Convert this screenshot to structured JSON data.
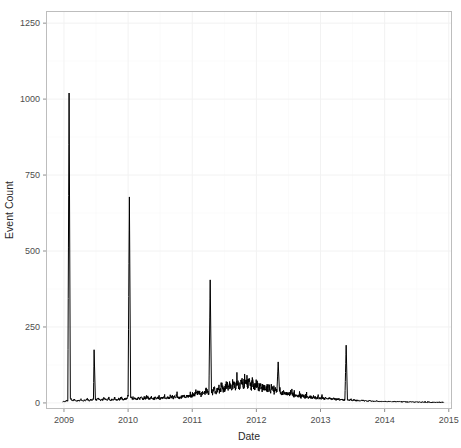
{
  "chart_data": {
    "type": "line",
    "title": "",
    "subtitle": "",
    "xlabel": "Date",
    "ylabel": "Event Count",
    "grid": true,
    "legend": null,
    "xlim": [
      2008.72,
      2015.05
    ],
    "ylim": [
      -20,
      1290
    ],
    "x_ticks": [
      "2009",
      "2010",
      "2011",
      "2012",
      "2013",
      "2014",
      "2015"
    ],
    "x_tick_values": [
      2009,
      2010,
      2011,
      2012,
      2013,
      2014,
      2015
    ],
    "y_ticks": [
      "0",
      "250",
      "500",
      "750",
      "1000",
      "1250"
    ],
    "y_tick_values": [
      0,
      250,
      500,
      750,
      1000,
      1250
    ],
    "series_name": "Event Count",
    "series_color": "#000000",
    "annotations": [
      {
        "label": "peak-2009",
        "x": 2009.08,
        "y": 1020
      },
      {
        "label": "peak-2009b",
        "x": 2009.47,
        "y": 175
      },
      {
        "label": "peak-2010",
        "x": 2010.02,
        "y": 678
      },
      {
        "label": "peak-2011",
        "x": 2011.3,
        "y": 405
      },
      {
        "label": "peak-2012",
        "x": 2012.28,
        "y": 135
      },
      {
        "label": "peak-2013",
        "x": 2013.4,
        "y": 190
      }
    ],
    "x": [
      2008.98,
      2009.0,
      2009.02,
      2009.04,
      2009.06,
      2009.08,
      2009.1,
      2009.12,
      2009.14,
      2009.16,
      2009.18,
      2009.2,
      2009.22,
      2009.24,
      2009.26,
      2009.28,
      2009.3,
      2009.32,
      2009.34,
      2009.36,
      2009.38,
      2009.4,
      2009.42,
      2009.44,
      2009.46,
      2009.47,
      2009.49,
      2009.51,
      2009.53,
      2009.55,
      2009.57,
      2009.59,
      2009.61,
      2009.63,
      2009.65,
      2009.67,
      2009.69,
      2009.71,
      2009.73,
      2009.75,
      2009.77,
      2009.79,
      2009.81,
      2009.83,
      2009.85,
      2009.87,
      2009.89,
      2009.91,
      2009.93,
      2009.95,
      2009.97,
      2009.99,
      2010.0,
      2010.02,
      2010.04,
      2010.06,
      2010.08,
      2010.1,
      2010.12,
      2010.14,
      2010.16,
      2010.18,
      2010.2,
      2010.22,
      2010.24,
      2010.26,
      2010.28,
      2010.3,
      2010.32,
      2010.34,
      2010.36,
      2010.38,
      2010.4,
      2010.42,
      2010.44,
      2010.46,
      2010.48,
      2010.5,
      2010.52,
      2010.54,
      2010.56,
      2010.58,
      2010.6,
      2010.62,
      2010.64,
      2010.66,
      2010.68,
      2010.7,
      2010.72,
      2010.74,
      2010.76,
      2010.78,
      2010.8,
      2010.82,
      2010.84,
      2010.86,
      2010.88,
      2010.9,
      2010.92,
      2010.94,
      2010.96,
      2010.98,
      2011.0,
      2011.02,
      2011.04,
      2011.06,
      2011.08,
      2011.1,
      2011.12,
      2011.14,
      2011.16,
      2011.18,
      2011.2,
      2011.22,
      2011.24,
      2011.26,
      2011.28,
      2011.3,
      2011.32,
      2011.34,
      2011.36,
      2011.38,
      2011.4,
      2011.42,
      2011.44,
      2011.46,
      2011.48,
      2011.5,
      2011.52,
      2011.54,
      2011.56,
      2011.58,
      2011.6,
      2011.62,
      2011.64,
      2011.66,
      2011.68,
      2011.7,
      2011.72,
      2011.74,
      2011.76,
      2011.78,
      2011.8,
      2011.82,
      2011.84,
      2011.86,
      2011.88,
      2011.9,
      2011.92,
      2011.94,
      2011.96,
      2011.98,
      2012.0,
      2012.02,
      2012.04,
      2012.06,
      2012.08,
      2012.1,
      2012.12,
      2012.14,
      2012.16,
      2012.18,
      2012.2,
      2012.22,
      2012.24,
      2012.26,
      2012.28,
      2012.3,
      2012.32,
      2012.34,
      2012.36,
      2012.38,
      2012.4,
      2012.42,
      2012.44,
      2012.46,
      2012.48,
      2012.5,
      2012.52,
      2012.54,
      2012.56,
      2012.58,
      2012.6,
      2012.62,
      2012.64,
      2012.66,
      2012.68,
      2012.7,
      2012.72,
      2012.74,
      2012.76,
      2012.78,
      2012.8,
      2012.82,
      2012.84,
      2012.86,
      2012.88,
      2012.9,
      2012.92,
      2012.94,
      2012.96,
      2012.98,
      2013.0,
      2013.02,
      2013.04,
      2013.06,
      2013.08,
      2013.1,
      2013.12,
      2013.14,
      2013.16,
      2013.18,
      2013.2,
      2013.22,
      2013.24,
      2013.26,
      2013.28,
      2013.3,
      2013.32,
      2013.34,
      2013.36,
      2013.38,
      2013.4,
      2013.42,
      2013.44,
      2013.46,
      2013.48,
      2013.5,
      2013.52,
      2013.54,
      2013.56,
      2013.58,
      2013.6,
      2013.62,
      2013.64,
      2013.66,
      2013.68,
      2013.7,
      2013.72,
      2013.74,
      2013.76,
      2013.78,
      2013.8,
      2013.82,
      2013.84,
      2013.86,
      2013.88,
      2013.9,
      2013.92,
      2013.94,
      2013.96,
      2013.98,
      2014.0,
      2014.02,
      2014.04,
      2014.06,
      2014.08,
      2014.1,
      2014.12,
      2014.14,
      2014.16,
      2014.18,
      2014.2,
      2014.22,
      2014.24,
      2014.26,
      2014.28,
      2014.3,
      2014.32,
      2014.34,
      2014.36,
      2014.38,
      2014.4,
      2014.42,
      2014.44,
      2014.46,
      2014.48,
      2014.5,
      2014.52,
      2014.54,
      2014.56,
      2014.58,
      2014.6,
      2014.62,
      2014.64,
      2014.66,
      2014.68,
      2014.7,
      2014.72,
      2014.74,
      2014.76,
      2014.78,
      2014.8,
      2014.82,
      2014.84,
      2014.86,
      2014.88,
      2014.9,
      2014.92
    ],
    "values": [
      3,
      5,
      4,
      8,
      6,
      1020,
      14,
      9,
      6,
      11,
      7,
      5,
      9,
      6,
      12,
      8,
      5,
      10,
      7,
      14,
      9,
      6,
      11,
      8,
      13,
      175,
      12,
      8,
      15,
      10,
      7,
      13,
      9,
      16,
      11,
      8,
      14,
      10,
      7,
      12,
      9,
      15,
      11,
      8,
      13,
      10,
      16,
      12,
      9,
      14,
      11,
      18,
      22,
      678,
      19,
      15,
      12,
      17,
      13,
      10,
      16,
      12,
      19,
      14,
      11,
      17,
      13,
      20,
      15,
      12,
      18,
      14,
      11,
      16,
      13,
      19,
      15,
      12,
      17,
      14,
      21,
      16,
      13,
      18,
      15,
      22,
      17,
      14,
      19,
      16,
      23,
      18,
      15,
      20,
      17,
      24,
      19,
      16,
      21,
      18,
      25,
      20,
      24,
      28,
      22,
      31,
      26,
      35,
      29,
      24,
      38,
      31,
      27,
      42,
      34,
      29,
      405,
      36,
      31,
      45,
      38,
      33,
      48,
      41,
      36,
      52,
      44,
      38,
      56,
      47,
      41,
      60,
      50,
      44,
      64,
      53,
      46,
      68,
      57,
      49,
      72,
      60,
      52,
      75,
      63,
      54,
      70,
      58,
      50,
      66,
      55,
      47,
      62,
      52,
      45,
      58,
      49,
      42,
      54,
      46,
      39,
      50,
      43,
      37,
      46,
      40,
      34,
      42,
      36,
      135,
      38,
      33,
      28,
      35,
      30,
      26,
      32,
      27,
      23,
      29,
      25,
      21,
      27,
      23,
      20,
      25,
      22,
      18,
      24,
      20,
      17,
      22,
      19,
      16,
      20,
      17,
      15,
      19,
      16,
      14,
      18,
      15,
      13,
      17,
      14,
      12,
      16,
      14,
      12,
      15,
      13,
      11,
      14,
      12,
      10,
      13,
      11,
      9,
      12,
      10,
      8,
      11,
      190,
      9,
      8,
      10,
      9,
      7,
      9,
      8,
      7,
      8,
      7,
      6,
      8,
      7,
      6,
      7,
      6,
      5,
      7,
      6,
      5,
      6,
      5,
      5,
      6,
      5,
      4,
      5,
      5,
      4,
      5,
      4,
      4,
      5,
      4,
      4,
      4,
      4,
      3,
      4,
      4,
      3,
      4,
      3,
      3,
      4,
      3,
      3,
      3,
      3,
      3,
      3,
      3,
      2,
      3,
      3,
      2,
      3,
      2,
      2,
      3,
      2,
      2,
      2,
      2,
      2,
      2,
      2,
      2,
      2,
      2,
      2,
      2,
      2,
      1,
      2,
      2
    ]
  },
  "accessibility": {
    "chart_region_name": "event-count-time-series"
  }
}
